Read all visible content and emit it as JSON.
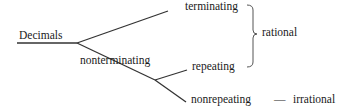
{
  "diagram": {
    "root": {
      "label": "Decimals"
    },
    "branches": {
      "terminating": {
        "label": "terminating"
      },
      "nonterminating": {
        "label": "nonterminating",
        "children": {
          "repeating": {
            "label": "repeating"
          },
          "nonrepeating": {
            "label": "nonrepeating"
          }
        }
      }
    },
    "groups": {
      "rational": {
        "label": "rational",
        "members": [
          "terminating",
          "repeating"
        ]
      },
      "irrational": {
        "label": "irrational",
        "members": [
          "nonrepeating"
        ],
        "connector": "—"
      }
    }
  },
  "colors": {
    "line": "#333333",
    "text": "#1a1a1a",
    "background": "#ffffff"
  }
}
